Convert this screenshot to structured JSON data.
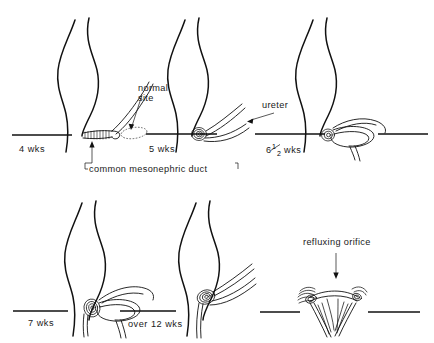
{
  "figure": {
    "background_color": "#ffffff",
    "ink_color": "#111111",
    "panel_count": 6
  },
  "panels": [
    {
      "id": "panel-4wks",
      "stage_label": "4 wks",
      "row": 1,
      "col": 1
    },
    {
      "id": "panel-5wks",
      "stage_label": "5 wks",
      "row": 1,
      "col": 2
    },
    {
      "id": "panel-6half-wks",
      "stage_label": "6½ wks",
      "row": 1,
      "col": 3,
      "fraction": {
        "whole": "6",
        "numerator": "1",
        "denominator": "2",
        "unit": "wks"
      }
    },
    {
      "id": "panel-7wks",
      "stage_label": "7 wks",
      "row": 2,
      "col": 1
    },
    {
      "id": "panel-over12wks",
      "stage_label": "over 12 wks",
      "row": 2,
      "col": 2
    },
    {
      "id": "panel-orifice",
      "stage_label": "",
      "row": 2,
      "col": 3
    }
  ],
  "annotations": [
    {
      "id": "annotation-normal-site",
      "text_line_1": "normal",
      "text_line_2": "site",
      "full_text": "normal site",
      "pointer": "arrow",
      "target_panel": "panel-4wks"
    },
    {
      "id": "annotation-common-mesonephric-duct",
      "text": "common mesonephric duct",
      "pointer": "arrow-up",
      "target_panel": "panel-4wks"
    },
    {
      "id": "annotation-ureter",
      "text": "ureter",
      "pointer": "arrow",
      "target_panel": "panel-5wks"
    },
    {
      "id": "annotation-refluxing-orifice",
      "text": "refluxing orifice",
      "pointer": "arrow-down",
      "target_panel": "panel-orifice"
    }
  ]
}
